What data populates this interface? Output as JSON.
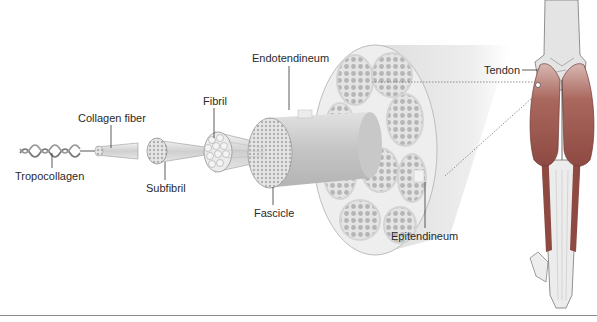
{
  "figure": {
    "labels": {
      "tropocollagen": "Tropocollagen",
      "collagen_fiber": "Collagen fiber",
      "subfibril": "Subfibril",
      "fibril": "Fibril",
      "endotendineum": "Endotendineum",
      "fascicle": "Fascicle",
      "epitendineum": "Epitendineum",
      "tendon": "Tendon"
    },
    "colors": {
      "structure_gray": "#d9d9d9",
      "structure_dark": "#a8a8a8",
      "muscle": "#9c5a52",
      "bone": "#e8e8e8",
      "leader_line": "#333333",
      "rule": "#8a8a8a"
    }
  }
}
